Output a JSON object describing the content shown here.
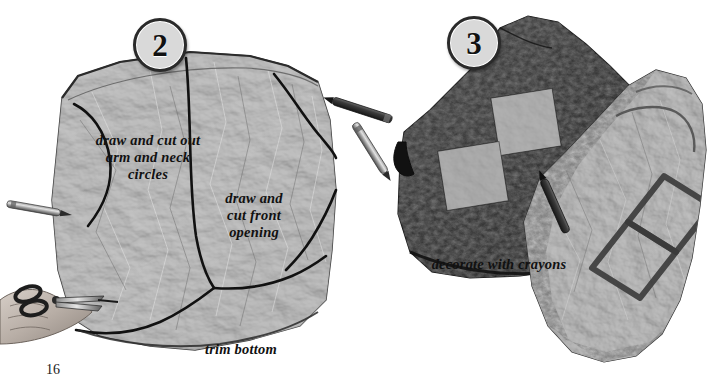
{
  "page": {
    "number": "16",
    "background_color": "#ffffff",
    "ink_color": "#111111",
    "paper_color": "#9a9a9a",
    "crayon_dark_color": "#3a3a3a",
    "patch_color": "#a0a0a0"
  },
  "steps": [
    {
      "id": "step-2",
      "badge": "2",
      "captions": {
        "arm_neck": "draw and cut out arm and neck circles",
        "front_opening": "draw and cut front opening",
        "trim_bottom": "trim bottom"
      }
    },
    {
      "id": "step-3",
      "badge": "3",
      "captions": {
        "decorate": "decorate with crayons"
      }
    }
  ],
  "objects": {
    "paper_bag": "paper-grocery-bag",
    "scissors": "scissors-in-hand",
    "crayons": [
      "crayon-left",
      "crayon-upper-middle",
      "crayon-lower-middle",
      "crayon-on-vest"
    ],
    "vest_back": "dark-crayon-shaded-vest",
    "vest_front": "light-vest-with-diamond-outlines"
  }
}
